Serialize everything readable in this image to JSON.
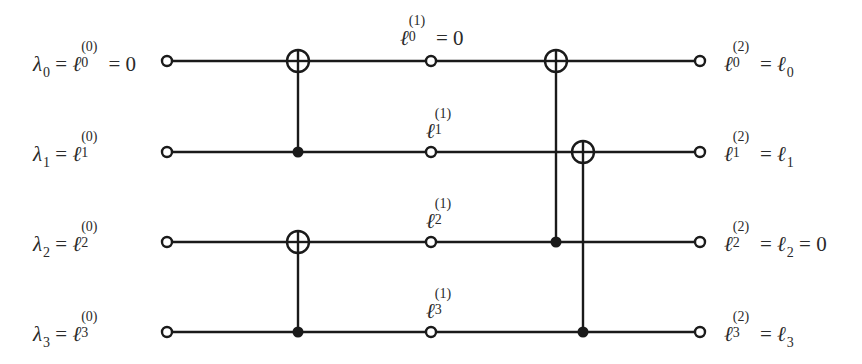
{
  "diagram": {
    "type": "reversible-circuit",
    "wires": [
      {
        "index": 0,
        "input_label": {
          "lhs_symbol": "λ",
          "lhs_sub": "0",
          "ell_sub": "0",
          "ell_sup": "(0)",
          "tail": "= 0"
        },
        "mid_label": {
          "ell_sub": "0",
          "ell_sup": "(1)",
          "tail": "= 0"
        },
        "output_label": {
          "ell_sub": "0",
          "ell_sup": "(2)",
          "rhs_sub": "0",
          "tail": ""
        }
      },
      {
        "index": 1,
        "input_label": {
          "lhs_symbol": "λ",
          "lhs_sub": "1",
          "ell_sub": "1",
          "ell_sup": "(0)",
          "tail": ""
        },
        "mid_label": {
          "ell_sub": "1",
          "ell_sup": "(1)",
          "tail": ""
        },
        "output_label": {
          "ell_sub": "1",
          "ell_sup": "(2)",
          "rhs_sub": "1",
          "tail": ""
        }
      },
      {
        "index": 2,
        "input_label": {
          "lhs_symbol": "λ",
          "lhs_sub": "2",
          "ell_sub": "2",
          "ell_sup": "(0)",
          "tail": ""
        },
        "mid_label": {
          "ell_sub": "2",
          "ell_sup": "(1)",
          "tail": ""
        },
        "output_label": {
          "ell_sub": "2",
          "ell_sup": "(2)",
          "rhs_sub": "2",
          "tail": "= 0"
        }
      },
      {
        "index": 3,
        "input_label": {
          "lhs_symbol": "λ",
          "lhs_sub": "3",
          "ell_sub": "3",
          "ell_sup": "(0)",
          "tail": ""
        },
        "mid_label": {
          "ell_sub": "3",
          "ell_sup": "(1)",
          "tail": ""
        },
        "output_label": {
          "ell_sub": "3",
          "ell_sup": "(2)",
          "rhs_sub": "3",
          "tail": ""
        }
      }
    ],
    "gates": [
      {
        "type": "CNOT",
        "control": 1,
        "target": 0,
        "column": 1
      },
      {
        "type": "CNOT",
        "control": 3,
        "target": 2,
        "column": 1
      },
      {
        "type": "CNOT",
        "control": 2,
        "target": 0,
        "column": 2
      },
      {
        "type": "CNOT",
        "control": 3,
        "target": 1,
        "column": 3
      }
    ],
    "symbols": {
      "equals": "=",
      "ell": "ℓ",
      "lambda": "λ"
    },
    "colors": {
      "line": "#1a1a1a",
      "background": "#ffffff"
    }
  }
}
